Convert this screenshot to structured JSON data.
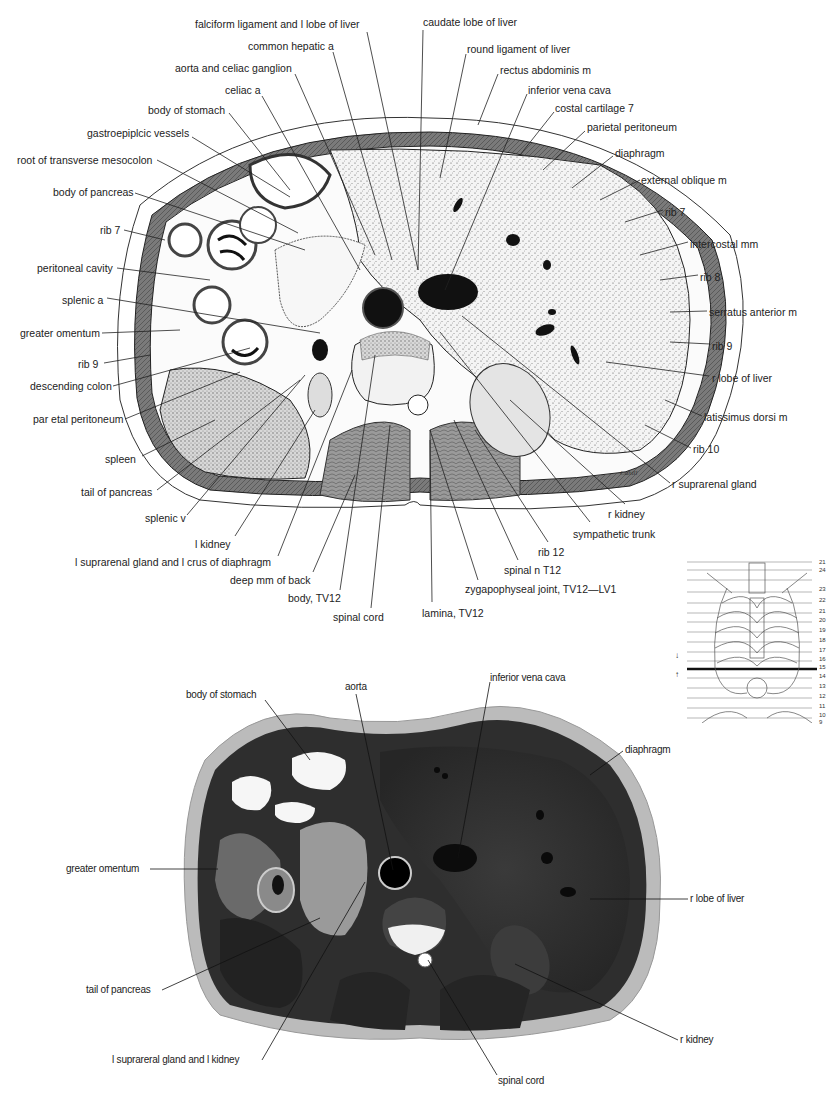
{
  "drawing": {
    "signature": "Cahill",
    "labels_left": [
      {
        "id": "falciform",
        "text": "falciform ligament and l lobe of liver",
        "x": 195,
        "y": 24
      },
      {
        "id": "common_hepatic",
        "text": "common hepatic a",
        "x": 248,
        "y": 46
      },
      {
        "id": "aorta_celiac",
        "text": "aorta and celiac ganglion",
        "x": 175,
        "y": 68
      },
      {
        "id": "celiac_a",
        "text": "celiac a",
        "x": 225,
        "y": 90
      },
      {
        "id": "body_stomach",
        "text": "body of stomach",
        "x": 148,
        "y": 108
      },
      {
        "id": "gastroepiploic",
        "text": "gastroepiplcic vessels",
        "x": 87,
        "y": 131
      },
      {
        "id": "root_mesocolon",
        "text": "root of transverse mesocolon",
        "x": 17,
        "y": 154
      },
      {
        "id": "body_pancreas",
        "text": "body of pancreas",
        "x": 53,
        "y": 186
      },
      {
        "id": "rib7_l",
        "text": "rib 7",
        "x": 100,
        "y": 224
      },
      {
        "id": "peritoneal_cavity",
        "text": "peritoneal cavity",
        "x": 37,
        "y": 262
      },
      {
        "id": "splenic_a",
        "text": "splenic a",
        "x": 62,
        "y": 294
      },
      {
        "id": "greater_omentum",
        "text": "greater omentum",
        "x": 20,
        "y": 327
      },
      {
        "id": "rib9_l",
        "text": "rib 9",
        "x": 78,
        "y": 358
      },
      {
        "id": "descending_colon",
        "text": "descending colon",
        "x": 30,
        "y": 380
      },
      {
        "id": "parietal_perit_l",
        "text": "par etal peritoneum",
        "x": 33,
        "y": 413
      },
      {
        "id": "spleen",
        "text": "spleen",
        "x": 105,
        "y": 453
      },
      {
        "id": "tail_pancreas",
        "text": "tail of pancreas",
        "x": 81,
        "y": 486
      },
      {
        "id": "splenic_v",
        "text": "splenic v",
        "x": 145,
        "y": 512
      },
      {
        "id": "l_kidney",
        "text": "l kidney",
        "x": 195,
        "y": 538
      },
      {
        "id": "l_suprarenal",
        "text": "l suprarenal gland and l crus of diaphragm",
        "x": 75,
        "y": 558
      },
      {
        "id": "deep_mm",
        "text": "deep mm of back",
        "x": 230,
        "y": 576
      },
      {
        "id": "body_tv12",
        "text": "body, TV12",
        "x": 288,
        "y": 593
      },
      {
        "id": "spinal_cord",
        "text": "spinal cord",
        "x": 333,
        "y": 611
      }
    ],
    "labels_right": [
      {
        "id": "caudate",
        "text": "caudate lobe of liver",
        "x": 423,
        "y": 16
      },
      {
        "id": "round_lig",
        "text": "round ligament of liver",
        "x": 467,
        "y": 43
      },
      {
        "id": "rectus",
        "text": "rectus abdominis m",
        "x": 500,
        "y": 64
      },
      {
        "id": "ivc",
        "text": "inferior vena cava",
        "x": 528,
        "y": 84
      },
      {
        "id": "costal_cart",
        "text": "costal cartilage 7",
        "x": 555,
        "y": 102
      },
      {
        "id": "parietal_perit_r",
        "text": "parietal peritoneum",
        "x": 587,
        "y": 121
      },
      {
        "id": "diaphragm",
        "text": "diaphragm",
        "x": 615,
        "y": 147
      },
      {
        "id": "ext_oblique",
        "text": "external oblique m",
        "x": 641,
        "y": 174
      },
      {
        "id": "rib7_r",
        "text": "rib 7",
        "x": 665,
        "y": 206
      },
      {
        "id": "intercostal",
        "text": "intercostal mm",
        "x": 690,
        "y": 238
      },
      {
        "id": "rib8",
        "text": "rib 8",
        "x": 700,
        "y": 271
      },
      {
        "id": "serratus",
        "text": "serratus anterior m",
        "x": 709,
        "y": 306
      },
      {
        "id": "rib9_r",
        "text": "rib 9",
        "x": 712,
        "y": 340
      },
      {
        "id": "r_lobe_liver",
        "text": "r lobe of liver",
        "x": 712,
        "y": 372
      },
      {
        "id": "latissimus",
        "text": "latissimus dorsi m",
        "x": 704,
        "y": 411
      },
      {
        "id": "rib10",
        "text": "rib 10",
        "x": 693,
        "y": 443
      },
      {
        "id": "r_suprarenal",
        "text": "r suprarenal gland",
        "x": 672,
        "y": 478
      },
      {
        "id": "r_kidney",
        "text": "r kidney",
        "x": 608,
        "y": 510
      },
      {
        "id": "sympathetic",
        "text": "sympathetic trunk",
        "x": 573,
        "y": 530
      },
      {
        "id": "rib12",
        "text": "rib 12",
        "x": 538,
        "y": 548
      },
      {
        "id": "spinal_n",
        "text": "spinal n T12",
        "x": 504,
        "y": 566
      },
      {
        "id": "zygapophyseal",
        "text": "zygapophyseal joint, TV12—LV1",
        "x": 465,
        "y": 584
      },
      {
        "id": "lamina",
        "text": "lamina, TV12",
        "x": 422,
        "y": 607
      }
    ]
  },
  "level_diagram": {
    "numbers": [
      "21",
      "24",
      "23",
      "22",
      "21",
      "20",
      "19",
      "18",
      "17",
      "16",
      "15",
      "14",
      "13",
      "12",
      "11",
      "10",
      "9"
    ],
    "selected_level_between": [
      "15",
      "14"
    ]
  },
  "photo": {
    "labels": [
      {
        "id": "p_body_stomach",
        "text": "body of stomach",
        "x": 186,
        "y": 693
      },
      {
        "id": "p_aorta",
        "text": "aorta",
        "x": 345,
        "y": 683
      },
      {
        "id": "p_ivc",
        "text": "inferior vena cava",
        "x": 490,
        "y": 674
      },
      {
        "id": "p_diaphragm",
        "text": "diaphragm",
        "x": 625,
        "y": 746
      },
      {
        "id": "p_greater_omentum",
        "text": "greater omentum",
        "x": 66,
        "y": 863
      },
      {
        "id": "p_r_lobe_liver",
        "text": "r lobe of liver",
        "x": 690,
        "y": 894
      },
      {
        "id": "p_tail_pancreas",
        "text": "tail of pancreas",
        "x": 86,
        "y": 984
      },
      {
        "id": "p_r_kidney",
        "text": "r kidney",
        "x": 680,
        "y": 1034
      },
      {
        "id": "p_l_suprarenal",
        "text": "l suprareral gland and l kidney",
        "x": 112,
        "y": 1054
      },
      {
        "id": "p_spinal_cord",
        "text": "spinal cord",
        "x": 498,
        "y": 1075
      }
    ]
  }
}
